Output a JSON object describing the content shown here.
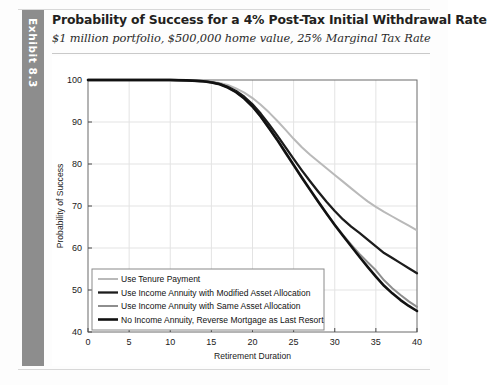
{
  "exhibit": {
    "tab_label": "Exhibit 8.3",
    "tab_color": "#8d8d8d"
  },
  "header": {
    "title": "Probability of Success for a 4% Post-Tax Initial Withdrawal Rate",
    "subtitle": "$1 million portfolio, $500,000 home value, 25% Marginal Tax Rate"
  },
  "chart_data": {
    "type": "line",
    "title": "Probability of Success for a 4% Post-Tax Initial Withdrawal Rate",
    "subtitle": "$1 million portfolio, $500,000 home value, 25% Marginal Tax Rate",
    "xlabel": "Retirement Duration",
    "ylabel": "Probability of Success",
    "xlim": [
      0,
      40
    ],
    "ylim": [
      40,
      100
    ],
    "xticks": [
      0,
      5,
      10,
      15,
      20,
      25,
      30,
      35,
      40
    ],
    "yticks": [
      40,
      50,
      60,
      70,
      80,
      90,
      100
    ],
    "xtick_labels": [
      "0",
      "5",
      "10",
      "15",
      "20",
      "25",
      "30",
      "35",
      "40"
    ],
    "ytick_labels": [
      "40",
      "50",
      "60",
      "70",
      "80",
      "90",
      "100"
    ],
    "grid": true,
    "legend_position": "lower left",
    "x": [
      0,
      2,
      4,
      6,
      8,
      10,
      12,
      14,
      15,
      16,
      17,
      18,
      19,
      20,
      21,
      22,
      23,
      24,
      25,
      26,
      27,
      28,
      29,
      30,
      31,
      32,
      33,
      34,
      35,
      36,
      37,
      38,
      39,
      40
    ],
    "series": [
      {
        "name": "Use Tenure Payment",
        "color": "#b9b9b9",
        "width": 2.0,
        "values": [
          100,
          100,
          100,
          100,
          100,
          100,
          99.9,
          99.8,
          99.6,
          99.3,
          98.8,
          98.0,
          97.0,
          95.7,
          94.1,
          92.3,
          90.3,
          88.2,
          86.0,
          84.0,
          82.2,
          80.6,
          79.0,
          77.4,
          75.8,
          74.2,
          72.6,
          71.1,
          69.8,
          68.6,
          67.5,
          66.4,
          65.3,
          64.2
        ]
      },
      {
        "name": "Use Income Annuity with Modified Asset Allocation",
        "color": "#1c1c1c",
        "width": 2.3,
        "values": [
          100,
          100,
          100,
          100,
          100,
          100,
          99.9,
          99.7,
          99.5,
          99.1,
          98.4,
          97.4,
          96.0,
          94.2,
          92.0,
          89.5,
          86.8,
          84.0,
          81.2,
          78.5,
          75.9,
          73.4,
          71.0,
          68.8,
          66.8,
          65.1,
          63.6,
          62.0,
          60.4,
          58.8,
          57.6,
          56.4,
          55.2,
          54.0
        ]
      },
      {
        "name": "Use Income Annuity with Same Asset Allocation",
        "color": "#8e8e8e",
        "width": 2.0,
        "values": [
          100,
          100,
          100,
          100,
          100,
          100,
          99.9,
          99.7,
          99.4,
          99.0,
          98.2,
          97.1,
          95.6,
          93.6,
          91.2,
          88.5,
          85.6,
          82.6,
          79.6,
          76.6,
          73.7,
          70.9,
          68.2,
          65.6,
          63.1,
          60.8,
          58.6,
          56.6,
          54.7,
          52.3,
          50.4,
          48.8,
          47.3,
          46.0
        ]
      },
      {
        "name": "No Income Annuity, Reverse Mortgage as Last Resort",
        "color": "#111111",
        "width": 2.6,
        "values": [
          100,
          100,
          100,
          100,
          100,
          100,
          99.9,
          99.7,
          99.4,
          99.0,
          98.2,
          97.1,
          95.6,
          93.7,
          91.3,
          88.6,
          85.8,
          82.8,
          79.8,
          76.8,
          73.9,
          71.0,
          68.2,
          65.5,
          62.9,
          60.4,
          57.9,
          55.5,
          53.2,
          51.0,
          49.2,
          47.6,
          46.2,
          45.0
        ]
      }
    ],
    "legend_entries": [
      "Use Tenure Payment",
      "Use Income Annuity with Modified Asset Allocation",
      "Use Income Annuity with Same Asset Allocation",
      "No Income Annuity, Reverse Mortgage as Last Resort"
    ]
  }
}
